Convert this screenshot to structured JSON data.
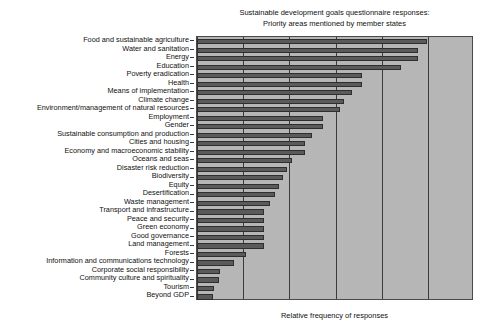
{
  "chart_data": {
    "type": "bar",
    "orientation": "horizontal",
    "title": "Sustainable development goals questionnaire responses:",
    "subtitle": "Priority areas mentioned by member states",
    "xlabel": "Relative frequency of responses",
    "ylabel": "",
    "grid": true,
    "legend": false,
    "xlim": [
      0,
      6
    ],
    "gridlines": [
      0,
      1,
      2,
      3,
      4,
      5
    ],
    "xtick_labels": [],
    "bar_color": "#5a5a5a",
    "plot_background": "#b6b6b6",
    "categories": [
      "Food and sustainable agriculture",
      "Water and sanitation",
      "Energy",
      "Education",
      "Poverty eradication",
      "Health",
      "Means of implementation",
      "Climate change",
      "Environment/management of natural resources",
      "Employment",
      "Gender",
      "Sustainable consumption and production",
      "Cities and housing",
      "Economy and macroeconomic stability",
      "Oceans and seas",
      "Disaster risk reduction",
      "Biodiversity",
      "Equity",
      "Desertification",
      "Waste management",
      "Transport and infrastructure",
      "Peace and security",
      "Green economy",
      "Good governance",
      "Land management",
      "Forests",
      "Information and communications technology",
      "Corporate social responsibility",
      "Community culture and spirituality",
      "Tourism",
      "Beyond GDP"
    ],
    "values": [
      4.98,
      4.79,
      4.79,
      4.42,
      3.58,
      3.58,
      3.36,
      3.19,
      3.1,
      2.72,
      2.72,
      2.5,
      2.35,
      2.35,
      2.05,
      1.96,
      1.86,
      1.77,
      1.7,
      1.58,
      1.45,
      1.45,
      1.45,
      1.45,
      1.45,
      1.07,
      0.81,
      0.49,
      0.47,
      0.36,
      0.34
    ]
  }
}
